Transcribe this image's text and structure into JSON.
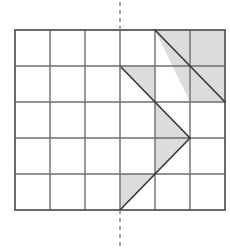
{
  "figure": {
    "canvas": {
      "width": 230,
      "height": 248
    },
    "colors": {
      "background": "#ffffff",
      "grid_line": "#6e6e6e",
      "outline": "#5a5a5a",
      "shade_fill": "#dcdcdc",
      "shape_stroke": "#3a3a3a",
      "mirror_line": "#8c8c8c"
    },
    "grid": {
      "columns": 6,
      "rows": 5,
      "cell_width": 35,
      "cell_height": 36,
      "origin_x": 15,
      "origin_y": 30,
      "x_lines": [
        15,
        50,
        85,
        120,
        155,
        190,
        225
      ],
      "y_lines": [
        30,
        66,
        102,
        138,
        174,
        210
      ],
      "line_width": 1.4
    },
    "mirror": {
      "label": "line of symmetry",
      "orientation": "vertical",
      "x": 120,
      "y_start": 2,
      "y_end": 246,
      "dash_pattern": "4 4",
      "width": 1.6
    },
    "shaded_shapes": [
      {
        "name": "top-diagonal-band",
        "points": "155,30 225,30 225,102 190,102",
        "description": "shaded band above diagonal from (155,30) to (225,102), top row and second row right cells"
      },
      {
        "name": "second-row-triangle",
        "points": "120,66 155,66 155,102",
        "description": "shaded triangle in row 2 between x=120 and x=155"
      },
      {
        "name": "arrow-head-triangle",
        "points": "155,102 190,138 155,174",
        "description": "right-pointing triangle spanning rows 3 and 4"
      },
      {
        "name": "bottom-left-triangle",
        "points": "120,174 155,174 120,210",
        "description": "shaded triangle in bottom row left of arrow"
      }
    ],
    "diagonal_strokes": [
      {
        "name": "top-long-diagonal",
        "x1": 155,
        "y1": 30,
        "x2": 225,
        "y2": 102
      },
      {
        "name": "second-row-diagonal",
        "x1": 120,
        "y1": 66,
        "x2": 155,
        "y2": 102
      },
      {
        "name": "arrow-upper-edge",
        "x1": 155,
        "y1": 102,
        "x2": 190,
        "y2": 138
      },
      {
        "name": "arrow-lower-edge",
        "x1": 190,
        "y1": 138,
        "x2": 155,
        "y2": 174
      },
      {
        "name": "bottom-diagonal",
        "x1": 120,
        "y1": 210,
        "x2": 155,
        "y2": 174
      }
    ]
  }
}
